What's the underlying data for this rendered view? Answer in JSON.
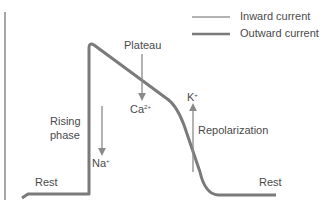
{
  "legend": {
    "items": [
      {
        "label": "Inward current",
        "color": "#9a9a9a",
        "width": 1.5
      },
      {
        "label": "Outward current",
        "color": "#7a7a7a",
        "width": 2.5
      }
    ]
  },
  "labels": {
    "plateau": "Plateau",
    "rising_line1": "Rising",
    "rising_line2": "phase",
    "rest_left": "Rest",
    "rest_right": "Rest",
    "repolarization": "Repolarization"
  },
  "ions": {
    "na": {
      "base": "Na",
      "sup": "+"
    },
    "ca": {
      "base": "Ca",
      "sup": "2+"
    },
    "k": {
      "base": "K",
      "sup": "+"
    }
  },
  "colors": {
    "curve": "#7a7a7a",
    "arrow": "#8a8a8a",
    "axis": "#8a8a8a"
  }
}
